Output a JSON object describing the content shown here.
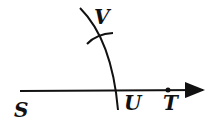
{
  "diagram": {
    "type": "geometric-construction",
    "points": [
      {
        "name": "S",
        "x": 14,
        "y": 110,
        "label_x": 14,
        "label_y": 117
      },
      {
        "name": "U",
        "x": 118,
        "y": 90,
        "label_x": 124,
        "label_y": 110
      },
      {
        "name": "T",
        "x": 168,
        "y": 90,
        "label_x": 163,
        "label_y": 110
      },
      {
        "name": "V",
        "x": 104,
        "y": 33,
        "label_x": 94,
        "label_y": 24
      }
    ],
    "labels": {
      "S": "S",
      "U": "U",
      "T": "T",
      "V": "V"
    },
    "colors": {
      "stroke": "#111111",
      "background": "#ffffff"
    }
  }
}
